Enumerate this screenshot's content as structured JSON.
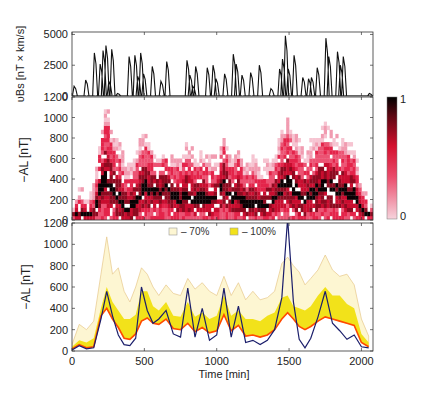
{
  "figure": {
    "x_label": "Time [min]",
    "x_ticks": [
      0,
      500,
      1000,
      1500,
      2000
    ],
    "x_range": [
      0,
      2080
    ]
  },
  "colors": {
    "heat_low": "#f4c9d3",
    "heat_mid": "#e0143c",
    "heat_high": "#000000",
    "band70": "#fdf6d2",
    "band70_edge": "#e6c78a",
    "band100": "#f2e21a",
    "line_orange": "#ff4a00",
    "line_navy": "#1b1e6b"
  },
  "panels": {
    "top": {
      "ylabel": "υBs [nT × km/s]",
      "yticks": [
        0,
        2500,
        5000
      ]
    },
    "mid": {
      "ylabel": "−AL [nT]",
      "yticks": [
        0,
        200,
        400,
        600,
        800,
        1000,
        1200
      ],
      "colorbar": {
        "max_label": "1",
        "min_label": "0"
      }
    },
    "bottom": {
      "ylabel": "−AL [nT]",
      "yticks": [
        0,
        200,
        400,
        600,
        800,
        1000,
        1200
      ],
      "legend": [
        {
          "label": "– 70%",
          "color": "#fdf6d2"
        },
        {
          "label": "– 100%",
          "color": "#f2e21a"
        }
      ]
    }
  },
  "chart_data": [
    {
      "type": "line",
      "title": "",
      "xlabel": "",
      "ylabel": "υBs [nT × km/s]",
      "ylim": [
        0,
        5200
      ],
      "series": [
        {
          "name": "vBs",
          "x": [
            0,
            20,
            40,
            60,
            80,
            100,
            120,
            140,
            160,
            180,
            200,
            220,
            240,
            260,
            280,
            300,
            320,
            340,
            360,
            380,
            400,
            420,
            440,
            460,
            480,
            500,
            520,
            540,
            560,
            580,
            600,
            620,
            640,
            660,
            680,
            700,
            720,
            740,
            760,
            780,
            800,
            820,
            840,
            860,
            880,
            900,
            920,
            940,
            960,
            980,
            1000,
            1020,
            1040,
            1060,
            1080,
            1100,
            1120,
            1140,
            1160,
            1180,
            1200,
            1220,
            1240,
            1260,
            1280,
            1300,
            1320,
            1340,
            1360,
            1380,
            1400,
            1420,
            1440,
            1460,
            1480,
            1500,
            1520,
            1540,
            1560,
            1580,
            1600,
            1620,
            1640,
            1660,
            1680,
            1700,
            1720,
            1740,
            1760,
            1780,
            1800,
            1820,
            1840,
            1860,
            1880,
            1900,
            1920,
            1940,
            1960,
            1980,
            2000,
            2020,
            2040,
            2060
          ],
          "values": [
            0,
            800,
            0,
            0,
            0,
            1300,
            0,
            0,
            3500,
            0,
            2600,
            3700,
            4100,
            1200,
            3800,
            0,
            200,
            0,
            0,
            0,
            3200,
            0,
            3300,
            1600,
            3500,
            1800,
            0,
            0,
            2400,
            0,
            0,
            1200,
            0,
            2800,
            0,
            0,
            0,
            0,
            0,
            0,
            2900,
            1700,
            800,
            2400,
            0,
            0,
            0,
            2300,
            0,
            2500,
            1400,
            0,
            0,
            1800,
            0,
            0,
            3400,
            2600,
            0,
            1700,
            0,
            0,
            1900,
            0,
            0,
            2500,
            0,
            0,
            0,
            600,
            0,
            0,
            2200,
            3000,
            4900,
            2200,
            0,
            3300,
            0,
            0,
            1500,
            0,
            1400,
            1500,
            0,
            2300,
            0,
            0,
            4700,
            3200,
            0,
            0,
            3600,
            2500,
            3200,
            0,
            0,
            0,
            0,
            0,
            0,
            0,
            0,
            200
          ]
        }
      ]
    },
    {
      "type": "heatmap",
      "xlabel": "",
      "ylabel": "−AL [nT]",
      "ylim": [
        0,
        1200
      ],
      "colorbar": {
        "min": 0,
        "max": 1
      },
      "description": "Normalized occurrence probability of −AL vs time; peaks near t≈240 (to ~1080 nT), t≈1050, t≈1490 (to ~1100 nT), t≈1780 (to ~900 nT); high-density core (black) follows ~0–400 nT."
    },
    {
      "type": "area",
      "xlabel": "Time [min]",
      "ylabel": "−AL [nT]",
      "ylim": [
        0,
        1200
      ],
      "xlim": [
        0,
        2080
      ],
      "legend": [
        "– 70%",
        "– 100%"
      ],
      "x": [
        0,
        50,
        100,
        150,
        200,
        240,
        280,
        320,
        360,
        400,
        440,
        480,
        520,
        560,
        600,
        650,
        700,
        750,
        800,
        850,
        900,
        950,
        1000,
        1050,
        1100,
        1150,
        1200,
        1250,
        1300,
        1350,
        1400,
        1450,
        1490,
        1530,
        1570,
        1610,
        1650,
        1700,
        1750,
        1800,
        1850,
        1900,
        1950,
        2000,
        2050
      ],
      "series": [
        {
          "name": "70% upper",
          "values": [
            60,
            250,
            200,
            280,
            720,
            1070,
            720,
            780,
            560,
            460,
            600,
            780,
            720,
            600,
            520,
            620,
            540,
            520,
            680,
            580,
            640,
            560,
            520,
            700,
            520,
            640,
            480,
            560,
            480,
            500,
            560,
            820,
            880,
            800,
            740,
            620,
            680,
            760,
            900,
            760,
            700,
            720,
            620,
            300,
            140
          ]
        },
        {
          "name": "100% upper",
          "values": [
            40,
            100,
            80,
            120,
            400,
            600,
            460,
            380,
            300,
            300,
            340,
            560,
            560,
            420,
            380,
            460,
            330,
            320,
            460,
            320,
            360,
            300,
            330,
            520,
            330,
            380,
            300,
            300,
            280,
            330,
            360,
            500,
            520,
            420,
            400,
            380,
            420,
            520,
            600,
            520,
            520,
            440,
            400,
            160,
            80
          ]
        },
        {
          "name": "median (orange)",
          "values": [
            20,
            60,
            30,
            40,
            330,
            400,
            300,
            220,
            120,
            110,
            160,
            280,
            310,
            260,
            250,
            300,
            210,
            200,
            260,
            180,
            220,
            170,
            190,
            340,
            190,
            240,
            140,
            150,
            130,
            150,
            200,
            300,
            360,
            300,
            230,
            200,
            230,
            280,
            320,
            300,
            280,
            260,
            240,
            80,
            40
          ]
        },
        {
          "name": "observed (navy)",
          "values": [
            10,
            50,
            20,
            30,
            300,
            560,
            330,
            150,
            60,
            50,
            120,
            600,
            380,
            260,
            300,
            380,
            160,
            130,
            590,
            130,
            400,
            100,
            150,
            590,
            130,
            420,
            80,
            100,
            60,
            100,
            200,
            500,
            1240,
            460,
            110,
            30,
            120,
            320,
            560,
            260,
            190,
            110,
            150,
            40,
            30
          ]
        }
      ]
    }
  ]
}
